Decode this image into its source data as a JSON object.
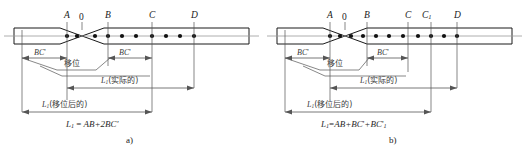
{
  "figure": {
    "type": "engineering-diagram",
    "stroke_color": "#1a1a1a",
    "dim_line_color": "#555555",
    "axis_color": "#888888",
    "marker_color": "#111111"
  },
  "panels": [
    {
      "id": "a",
      "caption": "a)",
      "formula": {
        "lhs": "L",
        "lhs_sub": "1",
        "eq": "=",
        "rhs": "AB+2BC'"
      },
      "point_labels": [
        {
          "text": "A",
          "style": "italic"
        },
        {
          "text": "0",
          "style": "upright"
        },
        {
          "text": "B",
          "style": "italic"
        },
        {
          "text": "C",
          "style": "italic"
        },
        {
          "text": "D",
          "style": "italic"
        }
      ],
      "dimensions": [
        {
          "name": "bc-left",
          "label": "BC'"
        },
        {
          "name": "bc-right",
          "label": "BC'"
        },
        {
          "name": "l1-actual",
          "label": "L1(实际的)",
          "main": "L",
          "sub": "1",
          "paren": "(实际的)"
        },
        {
          "name": "l1-shifted",
          "label": "L1(移位后的)",
          "main": "L",
          "sub": "1",
          "paren": "(移位后的)"
        }
      ],
      "neck_label": "移位",
      "marker_count": 12
    },
    {
      "id": "b",
      "caption": "b)",
      "formula": {
        "lhs": "L",
        "lhs_sub": "1",
        "eq": "=",
        "rhs": "AB+BC'+BC'1"
      },
      "point_labels": [
        {
          "text": "A",
          "style": "italic"
        },
        {
          "text": "0",
          "style": "upright"
        },
        {
          "text": "B",
          "style": "italic"
        },
        {
          "text": "C",
          "style": "italic"
        },
        {
          "text": "C1",
          "style": "italic"
        },
        {
          "text": "D",
          "style": "italic"
        }
      ],
      "dimensions": [
        {
          "name": "bc-left",
          "label": "BC'"
        },
        {
          "name": "bc-right",
          "label": "BC'"
        },
        {
          "name": "l1-actual",
          "label": "L1(实际的)",
          "main": "L",
          "sub": "1",
          "paren": "(实际的)"
        },
        {
          "name": "l1-shifted",
          "label": "L1(移位后的)",
          "main": "L",
          "sub": "1",
          "paren": "(移位后的)"
        }
      ],
      "neck_label": "移位",
      "marker_count": 12
    }
  ],
  "text": {
    "neck": "移位",
    "actual_paren": "(实际的)",
    "shifted_paren": "(移位后的)",
    "L": "L",
    "sub1": "1",
    "BC_prime": "BC",
    "prime": "'",
    "label_A": "A",
    "label_0": "0",
    "label_B": "B",
    "label_C": "C",
    "label_C1": "C",
    "label_C1_sub": "1",
    "label_D": "D",
    "caption_a": "a)",
    "caption_b": "b)",
    "formula_a_rhs": "AB+2BC",
    "formula_b_rhs_1": "AB+BC",
    "formula_b_rhs_2": "+BC",
    "formula_b_rhs_sub": "1",
    "equals": "="
  }
}
